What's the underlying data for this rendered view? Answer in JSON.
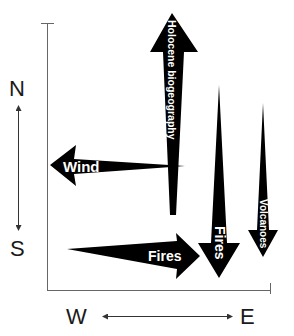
{
  "compass": {
    "north": "N",
    "south": "S",
    "west": "W",
    "east": "E"
  },
  "arrows": [
    {
      "id": "holocene",
      "label": "Holocene biogeography",
      "direction": "up"
    },
    {
      "id": "wind",
      "label": "Wind",
      "direction": "left"
    },
    {
      "id": "fires_east",
      "label": "Fires",
      "direction": "right"
    },
    {
      "id": "fires_south",
      "label": "Fires",
      "direction": "down"
    },
    {
      "id": "volcanoes",
      "label": "Volcanoes",
      "direction": "down"
    }
  ],
  "colors": {
    "arrow_fill": "#000000",
    "label_text": "#ffffff",
    "axis_line": "#555555",
    "compass_text": "#1a1a1a"
  }
}
